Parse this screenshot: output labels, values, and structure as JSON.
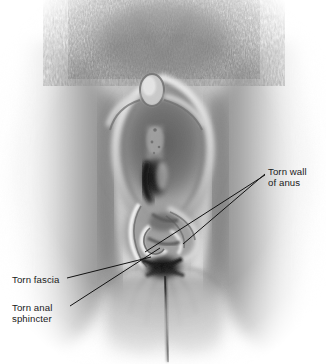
{
  "figure": {
    "width": 326,
    "height": 364,
    "background_color": "#ffffff",
    "style": "grayscale airbrush medical illustration",
    "ink_color": "#1a1a1a",
    "leader_line_color": "#111111"
  },
  "labels": [
    {
      "id": "torn-wall-of-anus",
      "lines": [
        "Torn wall",
        "of anus"
      ],
      "text": "Torn wall\nof anus",
      "x": 268,
      "y": 166,
      "align": "left"
    },
    {
      "id": "torn-fascia",
      "lines": [
        "Torn fascia"
      ],
      "text": "Torn fascia",
      "x": 12,
      "y": 274,
      "align": "left"
    },
    {
      "id": "torn-anal-sphincter",
      "lines": [
        "Torn anal",
        "sphincter"
      ],
      "text": "Torn anal\nsphincter",
      "x": 12,
      "y": 302,
      "align": "left"
    }
  ],
  "leader_lines": [
    {
      "id": "leader-torn-wall-of-anus",
      "from": [
        265,
        174
      ],
      "to": [
        183,
        244
      ]
    },
    {
      "id": "leader-torn-anal-sphincter-upper",
      "from": [
        265,
        175
      ],
      "to": [
        145,
        252
      ]
    },
    {
      "id": "leader-torn-fascia",
      "from": [
        67,
        278
      ],
      "to": [
        151,
        257
      ]
    },
    {
      "id": "leader-torn-anal-sphincter",
      "from": [
        70,
        306
      ],
      "to": [
        160,
        248
      ]
    }
  ],
  "anatomy_regions": [
    {
      "id": "pubic-hair",
      "label": "pubic hair",
      "cx": 163,
      "cy": 30
    },
    {
      "id": "clitoris",
      "label": "clitoris",
      "cx": 152,
      "cy": 90
    },
    {
      "id": "labia-minora",
      "label": "labia minora",
      "cx": 163,
      "cy": 140
    },
    {
      "id": "vaginal-introitus",
      "label": "vaginal introitus",
      "cx": 155,
      "cy": 175
    },
    {
      "id": "torn-tissue",
      "label": "torn perineal tissue",
      "cx": 160,
      "cy": 235
    },
    {
      "id": "anus",
      "label": "anus",
      "cx": 163,
      "cy": 270
    },
    {
      "id": "gluteal-cleft",
      "label": "gluteal cleft",
      "cx": 168,
      "cy": 320
    }
  ]
}
